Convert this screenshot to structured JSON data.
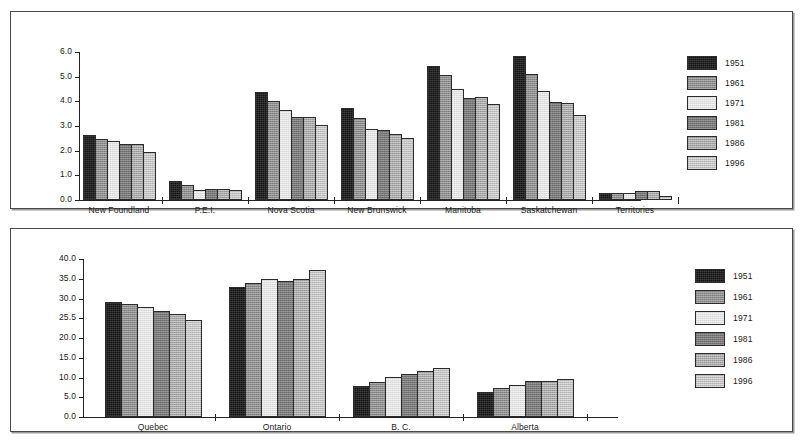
{
  "chart_data": [
    {
      "type": "bar",
      "title": "",
      "xlabel": "",
      "ylabel": "",
      "ylim": [
        0.0,
        6.0
      ],
      "ytick_labels": [
        "6.0",
        "5.0",
        "4.0",
        "3.0",
        "2.0",
        "1.0",
        "0.0"
      ],
      "ytick_values": [
        6.0,
        5.0,
        4.0,
        3.0,
        2.0,
        1.0,
        0.0
      ],
      "grid": false,
      "legend_position": "right",
      "categories": [
        "New Foundland",
        "P.E.I.",
        "Nova Scotia",
        "New Brunswick",
        "Manitoba",
        "Saskatchewan",
        "Territories"
      ],
      "series": [
        {
          "name": "1951",
          "color": "#141414",
          "values": [
            2.63,
            0.75,
            4.38,
            3.73,
            5.42,
            5.85,
            0.28
          ]
        },
        {
          "name": "1961",
          "color": "#8e8e8e",
          "values": [
            2.47,
            0.6,
            4.0,
            3.31,
            5.07,
            5.09,
            0.28
          ]
        },
        {
          "name": "1971",
          "color": "#e2e2e2",
          "values": [
            2.41,
            0.4,
            3.65,
            2.87,
            4.52,
            4.41,
            0.3
          ]
        },
        {
          "name": "1981",
          "color": "#7b7b7b",
          "values": [
            2.26,
            0.43,
            3.36,
            2.85,
            4.15,
            3.98,
            0.37
          ]
        },
        {
          "name": "1986",
          "color": "#a8a8a8",
          "values": [
            2.27,
            0.43,
            3.38,
            2.68,
            4.16,
            3.95,
            0.37
          ]
        },
        {
          "name": "1996",
          "color": "#c2c2c2",
          "values": [
            1.94,
            0.4,
            3.03,
            2.52,
            3.89,
            3.44,
            0.18
          ]
        }
      ]
    },
    {
      "type": "bar",
      "title": "",
      "xlabel": "",
      "ylabel": "",
      "ylim": [
        0.0,
        40.0
      ],
      "ytick_labels": [
        "40.0",
        "35.0",
        "30.0",
        "25.5",
        "20.0",
        "15.0",
        "10.0",
        "5.0",
        "0.0"
      ],
      "ytick_values": [
        40.0,
        35.0,
        30.0,
        25.0,
        20.0,
        15.0,
        10.0,
        5.0,
        0.0
      ],
      "grid": false,
      "legend_position": "right",
      "categories": [
        "Quebec",
        "Ontario",
        "B. C.",
        "Alberta"
      ],
      "series": [
        {
          "name": "1951",
          "color": "#141414",
          "values": [
            29.0,
            33.0,
            7.8,
            6.4
          ]
        },
        {
          "name": "1961",
          "color": "#8e8e8e",
          "values": [
            28.5,
            33.9,
            8.9,
            7.3
          ]
        },
        {
          "name": "1971",
          "color": "#e2e2e2",
          "values": [
            27.9,
            35.0,
            10.0,
            8.0
          ]
        },
        {
          "name": "1981",
          "color": "#7b7b7b",
          "values": [
            26.9,
            34.4,
            10.9,
            9.1
          ]
        },
        {
          "name": "1986",
          "color": "#a8a8a8",
          "values": [
            26.0,
            35.0,
            11.7,
            9.1
          ]
        },
        {
          "name": "1996",
          "color": "#c2c2c2",
          "values": [
            24.5,
            37.1,
            12.5,
            9.6
          ]
        }
      ]
    }
  ],
  "legend": {
    "entries": [
      {
        "label": "1951"
      },
      {
        "label": "1961"
      },
      {
        "label": "1971"
      },
      {
        "label": "1981"
      },
      {
        "label": "1986"
      },
      {
        "label": "1996"
      }
    ]
  }
}
